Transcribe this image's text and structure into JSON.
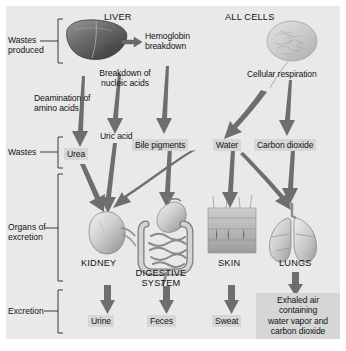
{
  "figure": {
    "background_color": "#e9e9e9",
    "text_color": "#141414",
    "label_box_color": "#d6d6d6",
    "arrow_color": "#6e6e6e"
  },
  "row_labels": [
    {
      "id": "wastes-produced",
      "line1": "Wastes",
      "line2": "produced"
    },
    {
      "id": "wastes",
      "line1": "Wastes",
      "line2": ""
    },
    {
      "id": "organs-of-excretion",
      "line1": "Organs of",
      "line2": "excretion"
    },
    {
      "id": "excretion",
      "line1": "Excretion",
      "line2": ""
    }
  ],
  "sources": [
    {
      "id": "liver",
      "label": "LIVER"
    },
    {
      "id": "all-cells",
      "label": "ALL CELLS"
    }
  ],
  "processes": [
    {
      "id": "hemoglobin-breakdown",
      "line1": "Hemoglobin",
      "line2": "breakdown"
    },
    {
      "id": "breakdown-nucleic-acids",
      "line1": "Breakdown of",
      "line2": "nucleic acids"
    },
    {
      "id": "deamination-amino-acids",
      "line1": "Deamination of",
      "line2": "amino acids"
    },
    {
      "id": "cellular-respiration",
      "line1": "Cellular respiration",
      "line2": ""
    }
  ],
  "wastes": [
    {
      "id": "uric-acid",
      "label": "Uric acid",
      "boxed": false
    },
    {
      "id": "urea",
      "label": "Urea",
      "boxed": true
    },
    {
      "id": "bile-pigments",
      "label": "Bile pigments",
      "boxed": true
    },
    {
      "id": "water",
      "label": "Water",
      "boxed": true
    },
    {
      "id": "carbon-dioxide",
      "label": "Carbon dioxide",
      "boxed": true
    }
  ],
  "organs": [
    {
      "id": "kidney",
      "label": "KIDNEY"
    },
    {
      "id": "digestive-system",
      "line1": "DIGESTIVE",
      "line2": "SYSTEM"
    },
    {
      "id": "skin",
      "label": "SKIN"
    },
    {
      "id": "lungs",
      "label": "LUNGS"
    }
  ],
  "excretions": [
    {
      "id": "urine",
      "label": "Urine"
    },
    {
      "id": "feces",
      "label": "Feces"
    },
    {
      "id": "sweat",
      "label": "Sweat"
    },
    {
      "id": "exhaled-air",
      "line1": "Exhaled air",
      "line2": "containing",
      "line3": "water vapor and",
      "line4": "carbon dioxide"
    }
  ]
}
